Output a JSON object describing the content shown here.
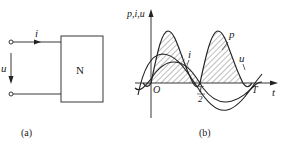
{
  "figure_a": {
    "caption": "(a)",
    "current_label": "i",
    "voltage_label": "u",
    "network_label": "N"
  },
  "figure_b": {
    "caption": "(b)",
    "y_axis_label": "p,i,u",
    "x_axis_label": "t",
    "origin_label": "O",
    "half_period_label_num": "T",
    "half_period_label_den": "2",
    "period_label": "T",
    "curve_labels": {
      "power": "p",
      "current": "i",
      "voltage": "u"
    }
  },
  "colors": {
    "line": "#222222",
    "background": "#ffffff"
  }
}
